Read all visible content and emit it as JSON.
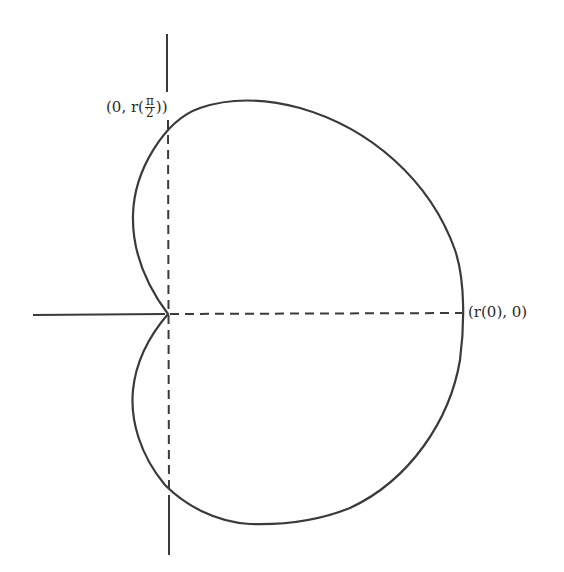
{
  "figure": {
    "stroke_color": "#3a3a3a",
    "background": "#ffffff"
  },
  "labels": {
    "top_point": {
      "open": "(0, r(",
      "numerator": "π",
      "denominator": "2",
      "close": "))"
    },
    "right_point": {
      "text": "(r(0), 0)"
    }
  },
  "geometry": {
    "origin": [
      168,
      314
    ],
    "right_intercept": [
      463,
      314
    ],
    "top_intercept_on_axis": [
      168,
      120
    ],
    "bottom_intercept_on_axis": [
      168,
      497
    ]
  }
}
